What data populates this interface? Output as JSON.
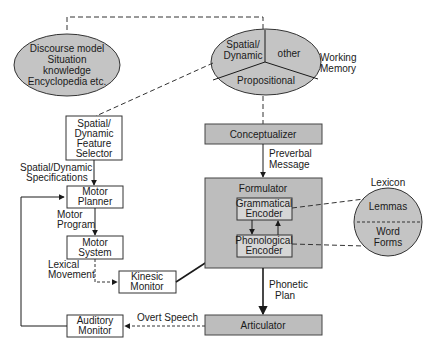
{
  "diagram": {
    "nodes": {
      "discourse_model": {
        "lines": [
          "Discourse model",
          "Situation",
          "knowledge",
          "Encyclopedia etc."
        ]
      },
      "working_memory": {
        "sections": {
          "spatial_dynamic": [
            "Spatial/",
            "Dynamic"
          ],
          "other": "other",
          "propositional": "Propositional"
        },
        "label": [
          "Working",
          "Memory"
        ]
      },
      "feature_selector": {
        "lines": [
          "Spatial/",
          "Dynamic",
          "Feature",
          "Selector"
        ]
      },
      "motor_planner": {
        "lines": [
          "Motor",
          "Planner"
        ]
      },
      "motor_system": {
        "lines": [
          "Motor",
          "System"
        ]
      },
      "kinesic_monitor": {
        "lines": [
          "Kinesic",
          "Monitor"
        ]
      },
      "auditory_monitor": {
        "lines": [
          "Auditory",
          "Monitor"
        ]
      },
      "conceptualizer": {
        "label": "Conceptualizer"
      },
      "formulator": {
        "label": "Formulator"
      },
      "grammatical_encoder": {
        "lines": [
          "Grammatical",
          "Encoder"
        ]
      },
      "phonological_encoder": {
        "lines": [
          "Phonological",
          "Encoder"
        ]
      },
      "articulator": {
        "label": "Articulator"
      },
      "lexicon": {
        "title": "Lexicon",
        "top": "Lemmas",
        "bottom": [
          "Word",
          "Forms"
        ]
      }
    },
    "edge_labels": {
      "spatial_specs": [
        "Spatial/Dynamic",
        "Specifications"
      ],
      "motor_program": [
        "Motor",
        "Program"
      ],
      "lexical_movement": [
        "Lexical",
        "Movement"
      ],
      "preverbal_message": [
        "Preverbal",
        "Message"
      ],
      "phonetic_plan": [
        "Phonetic",
        "Plan"
      ],
      "overt_speech": "Overt Speech"
    },
    "colors": {
      "grey_fill": "#bdbdbd",
      "light_fill": "#d6d6d6",
      "line": "#1a1a1a"
    }
  }
}
